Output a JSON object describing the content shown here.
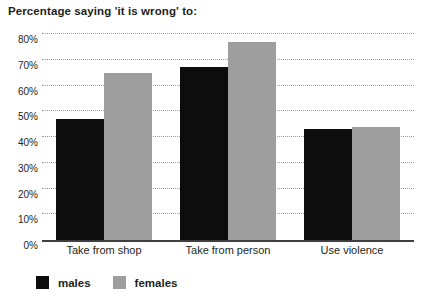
{
  "chart_data": {
    "type": "bar",
    "title": "Percentage saying 'it is wrong' to:",
    "subtitle": "",
    "xlabel": "",
    "ylabel": "",
    "categories": [
      "Take from shop",
      "Take from person",
      "Use violence"
    ],
    "series": [
      {
        "name": "males",
        "color": "#0d0d0d",
        "values": [
          47,
          67,
          43
        ]
      },
      {
        "name": "females",
        "color": "#9e9e9e",
        "values": [
          65,
          77,
          44
        ]
      }
    ],
    "ylim": [
      0,
      80
    ],
    "ytick_step": 10,
    "ytick_labels": [
      "0%",
      "10%",
      "20%",
      "30%",
      "40%",
      "50%",
      "60%",
      "70%",
      "80%"
    ],
    "ytick_values": [
      0,
      10,
      20,
      30,
      40,
      50,
      60,
      70,
      80
    ],
    "grid": true,
    "grid_style": "dotted",
    "grid_color": "#9b9b9b",
    "legend_position": "bottom-left",
    "axis_color": "#3f3f3f",
    "background": "#ffffff"
  },
  "legend": {
    "items": [
      {
        "label": "males",
        "color": "#0d0d0d"
      },
      {
        "label": "females",
        "color": "#9e9e9e"
      }
    ]
  }
}
